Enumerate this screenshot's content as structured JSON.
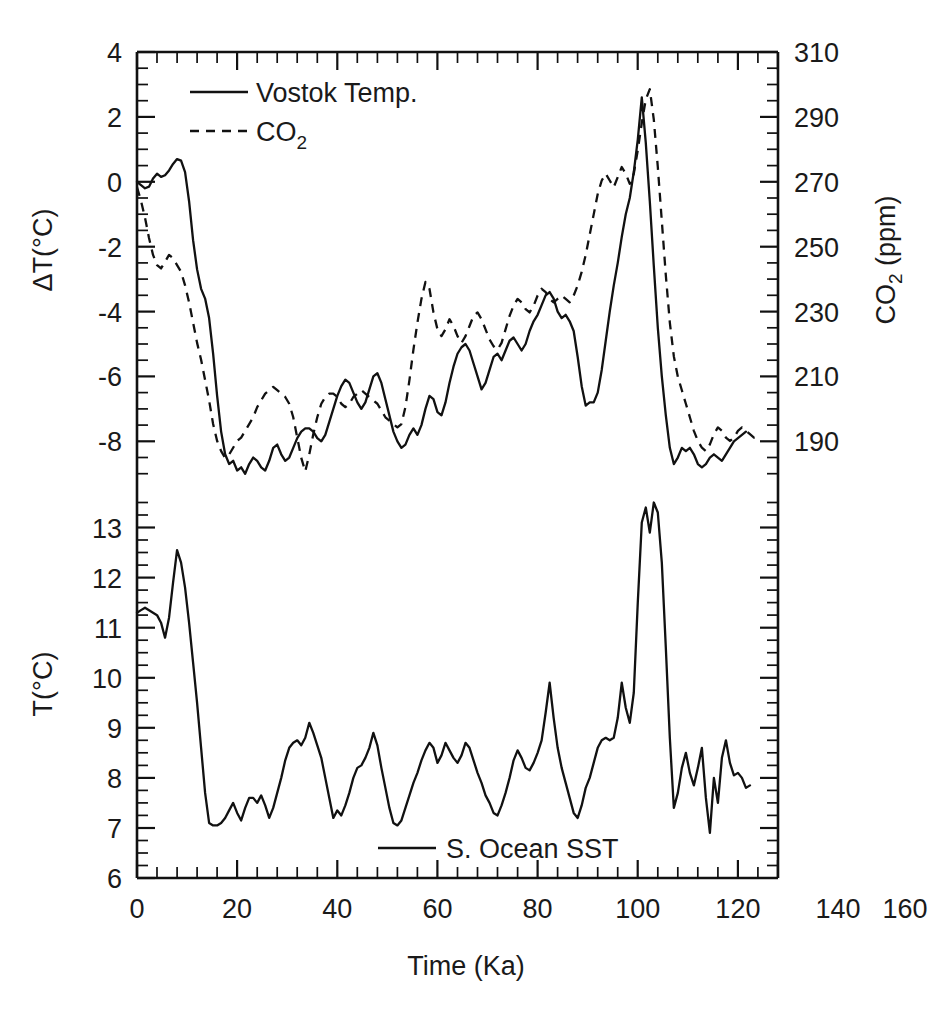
{
  "figure": {
    "background_color": "#ffffff",
    "line_color": "#111111",
    "xlabel": "Time (Ka)"
  },
  "chart_data": [
    {
      "type": "line",
      "panel": "top",
      "title": "",
      "xlabel": "Time (Ka)",
      "ylabel": "ΔT(°C)",
      "ylabel_right": "CO2 (ppm)",
      "ylabel_right_base": "CO",
      "ylabel_right_sub": "2",
      "ylabel_right_unit": " (ppm)",
      "xlim": [
        0,
        160
      ],
      "ylim": [
        -9.5,
        4
      ],
      "ylim_right": [
        180.5,
        310
      ],
      "xticks": [
        0,
        20,
        40,
        60,
        80,
        100,
        120,
        140,
        160
      ],
      "yticks": [
        4,
        2,
        0,
        -2,
        -4,
        -6,
        -8
      ],
      "yticks_right": [
        310,
        290,
        270,
        250,
        230,
        210,
        190
      ],
      "minor_ticks_per_interval": 4,
      "grid": false,
      "legend_position": "upper-left",
      "series": [
        {
          "name": "Vostok Temp.",
          "style": "solid",
          "axis": "left",
          "x": [
            0,
            1,
            2,
            3,
            4,
            5,
            6,
            7,
            8,
            9,
            10,
            11,
            12,
            13,
            14,
            15,
            16,
            17,
            18,
            19,
            20,
            21,
            22,
            23,
            24,
            25,
            26,
            27,
            28,
            29,
            30,
            31,
            32,
            33,
            34,
            35,
            36,
            37,
            38,
            39,
            40,
            41,
            42,
            43,
            44,
            45,
            46,
            47,
            48,
            49,
            50,
            51,
            52,
            53,
            54,
            55,
            56,
            57,
            58,
            59,
            60,
            61,
            62,
            63,
            64,
            65,
            66,
            67,
            68,
            69,
            70,
            71,
            72,
            73,
            74,
            75,
            76,
            77,
            78,
            79,
            80,
            81,
            82,
            83,
            84,
            85,
            86,
            87,
            88,
            89,
            90,
            91,
            92,
            93,
            94,
            95,
            96,
            97,
            98,
            99,
            100,
            101,
            102,
            103,
            104,
            105,
            106,
            107,
            108,
            109,
            110,
            111,
            112,
            113,
            114,
            115,
            116,
            117,
            118,
            119,
            120,
            121,
            122,
            123,
            124,
            125,
            126,
            127,
            128,
            129,
            130,
            131,
            132,
            133,
            134,
            135,
            136,
            137,
            138,
            139,
            140,
            141,
            142,
            143,
            144,
            145,
            146,
            147,
            148,
            149,
            150,
            151,
            152,
            153,
            154,
            155
          ],
          "y": [
            0.0,
            -0.1,
            -0.2,
            -0.15,
            0.1,
            0.25,
            0.15,
            0.2,
            0.35,
            0.55,
            0.7,
            0.65,
            0.3,
            -0.6,
            -1.8,
            -2.7,
            -3.3,
            -3.6,
            -4.2,
            -5.3,
            -6.6,
            -7.7,
            -8.4,
            -8.7,
            -8.6,
            -8.9,
            -8.8,
            -9.0,
            -8.7,
            -8.5,
            -8.6,
            -8.8,
            -8.9,
            -8.6,
            -8.2,
            -8.1,
            -8.4,
            -8.6,
            -8.5,
            -8.2,
            -7.9,
            -7.7,
            -7.6,
            -7.6,
            -7.7,
            -7.9,
            -8.0,
            -7.8,
            -7.4,
            -7.0,
            -6.6,
            -6.3,
            -6.1,
            -6.2,
            -6.5,
            -6.8,
            -7.0,
            -6.8,
            -6.4,
            -6.0,
            -5.9,
            -6.2,
            -6.7,
            -7.2,
            -7.7,
            -8.0,
            -8.2,
            -8.1,
            -7.8,
            -7.6,
            -7.8,
            -7.5,
            -7.0,
            -6.6,
            -6.7,
            -7.1,
            -7.2,
            -6.8,
            -6.2,
            -5.7,
            -5.3,
            -5.1,
            -5.0,
            -5.2,
            -5.6,
            -6.0,
            -6.4,
            -6.2,
            -5.8,
            -5.4,
            -5.3,
            -5.5,
            -5.2,
            -4.9,
            -4.8,
            -5.0,
            -5.2,
            -5.0,
            -4.6,
            -4.3,
            -4.1,
            -3.8,
            -3.5,
            -3.4,
            -3.6,
            -4.0,
            -4.2,
            -4.1,
            -4.3,
            -4.6,
            -5.4,
            -6.3,
            -6.9,
            -6.8,
            -6.8,
            -6.5,
            -5.8,
            -4.9,
            -4.0,
            -3.2,
            -2.5,
            -1.7,
            -1.0,
            -0.5,
            0.3,
            1.3,
            2.6,
            1.2,
            -0.6,
            -2.6,
            -4.5,
            -6.0,
            -7.2,
            -8.2,
            -8.7,
            -8.5,
            -8.2,
            -8.3,
            -8.2,
            -8.4,
            -8.7,
            -8.8,
            -8.7,
            -8.5,
            -8.4,
            -8.5,
            -8.6,
            -8.4,
            -8.2,
            -8.0,
            -7.9,
            -7.8,
            -7.7
          ]
        },
        {
          "name": "CO2",
          "label_base": "CO",
          "label_sub": "2",
          "style": "dashed",
          "axis": "right",
          "x": [
            0,
            1,
            2,
            3,
            4,
            5,
            6,
            7,
            8,
            9,
            10,
            11,
            12,
            13,
            14,
            15,
            16,
            17,
            18,
            19,
            20,
            21,
            22,
            23,
            24,
            25,
            26,
            27,
            28,
            29,
            30,
            31,
            32,
            33,
            34,
            35,
            36,
            37,
            38,
            39,
            40,
            41,
            42,
            43,
            44,
            45,
            46,
            47,
            48,
            49,
            50,
            51,
            52,
            53,
            54,
            55,
            56,
            57,
            58,
            59,
            60,
            61,
            62,
            63,
            64,
            65,
            66,
            67,
            68,
            69,
            70,
            71,
            72,
            73,
            74,
            75,
            76,
            77,
            78,
            79,
            80,
            81,
            82,
            83,
            84,
            85,
            86,
            87,
            88,
            89,
            90,
            91,
            92,
            93,
            94,
            95,
            96,
            97,
            98,
            99,
            100,
            101,
            102,
            103,
            104,
            105,
            106,
            107,
            108,
            109,
            110,
            111,
            112,
            113,
            114,
            115,
            116,
            117,
            118,
            119,
            120,
            121,
            122,
            123,
            124,
            125,
            126,
            127,
            128,
            129,
            130,
            131,
            132,
            133,
            134,
            135,
            136,
            137,
            138,
            139,
            140,
            141,
            142,
            143,
            144,
            145,
            146,
            147,
            148,
            149,
            150,
            151,
            152,
            153,
            154,
            155
          ],
          "y_ppm": [
            270,
            266,
            261,
            255,
            250,
            247,
            246,
            248,
            250,
            249,
            247,
            245,
            241,
            236,
            230,
            224,
            219,
            213,
            207,
            200,
            195,
            192,
            190,
            191,
            193,
            195,
            196,
            198,
            200,
            202,
            205,
            207,
            209,
            210,
            211,
            210,
            209,
            208,
            206,
            202,
            196,
            190,
            186,
            191,
            197,
            202,
            206,
            208,
            209,
            209,
            208,
            206,
            205,
            206,
            208,
            209,
            210,
            209,
            208,
            207,
            206,
            204,
            202,
            201,
            200,
            199,
            200,
            205,
            213,
            222,
            230,
            237,
            242,
            240,
            233,
            228,
            226,
            228,
            231,
            229,
            226,
            224,
            226,
            229,
            232,
            233,
            231,
            228,
            225,
            223,
            222,
            224,
            228,
            232,
            235,
            237,
            236,
            234,
            233,
            235,
            238,
            240,
            239,
            237,
            236,
            237,
            238,
            237,
            236,
            238,
            241,
            245,
            250,
            256,
            262,
            268,
            272,
            274,
            272,
            270,
            273,
            276,
            274,
            271,
            274,
            281,
            289,
            296,
            299,
            290,
            276,
            260,
            244,
            230,
            220,
            214,
            210,
            206,
            202,
            198,
            195,
            193,
            192,
            194,
            197,
            199,
            198,
            196,
            195,
            196,
            198,
            199,
            198,
            197,
            196,
            197,
            198
          ]
        }
      ]
    },
    {
      "type": "line",
      "panel": "bottom",
      "title": "",
      "xlabel": "Time (Ka)",
      "ylabel": "T(°C)",
      "xlim": [
        0,
        160
      ],
      "ylim": [
        6,
        13.75
      ],
      "xticks": [
        0,
        20,
        40,
        60,
        80,
        100,
        120,
        140,
        160
      ],
      "yticks": [
        13,
        12,
        11,
        10,
        9,
        8,
        7,
        6
      ],
      "minor_ticks_per_interval": 4,
      "grid": false,
      "legend_position": "bottom-center",
      "series": [
        {
          "name": "S. Ocean SST",
          "style": "solid",
          "axis": "left",
          "x": [
            0,
            1,
            2,
            3,
            4,
            5,
            6,
            7,
            8,
            9,
            10,
            11,
            12,
            13,
            14,
            15,
            16,
            17,
            18,
            19,
            20,
            21,
            22,
            23,
            24,
            25,
            26,
            27,
            28,
            29,
            30,
            31,
            32,
            33,
            34,
            35,
            36,
            37,
            38,
            39,
            40,
            41,
            42,
            43,
            44,
            45,
            46,
            47,
            48,
            49,
            50,
            51,
            52,
            53,
            54,
            55,
            56,
            57,
            58,
            59,
            60,
            61,
            62,
            63,
            64,
            65,
            66,
            67,
            68,
            69,
            70,
            71,
            72,
            73,
            74,
            75,
            76,
            77,
            78,
            79,
            80,
            81,
            82,
            83,
            84,
            85,
            86,
            87,
            88,
            89,
            90,
            91,
            92,
            93,
            94,
            95,
            96,
            97,
            98,
            99,
            100,
            101,
            102,
            103,
            104,
            105,
            106,
            107,
            108,
            109,
            110,
            111,
            112,
            113,
            114,
            115,
            116,
            117,
            118,
            119,
            120,
            121,
            122,
            123,
            124,
            125,
            126,
            127,
            128,
            129,
            130,
            131,
            132,
            133,
            134,
            135,
            136,
            137,
            138,
            139,
            140,
            141,
            142,
            143,
            144,
            145,
            146,
            147,
            148,
            149,
            150,
            151,
            152,
            153,
            154,
            155
          ],
          "y": [
            11.3,
            11.35,
            11.4,
            11.35,
            11.3,
            11.25,
            11.1,
            10.8,
            11.2,
            11.9,
            12.55,
            12.3,
            11.8,
            11.1,
            10.3,
            9.5,
            8.6,
            7.7,
            7.1,
            7.05,
            7.05,
            7.1,
            7.2,
            7.35,
            7.5,
            7.3,
            7.15,
            7.4,
            7.6,
            7.6,
            7.5,
            7.65,
            7.45,
            7.2,
            7.4,
            7.7,
            8.0,
            8.35,
            8.6,
            8.7,
            8.75,
            8.65,
            8.8,
            9.1,
            8.9,
            8.65,
            8.4,
            8.0,
            7.6,
            7.2,
            7.35,
            7.25,
            7.45,
            7.7,
            8.0,
            8.2,
            8.25,
            8.4,
            8.6,
            8.9,
            8.65,
            8.2,
            7.8,
            7.4,
            7.1,
            7.05,
            7.15,
            7.4,
            7.65,
            7.9,
            8.1,
            8.35,
            8.55,
            8.7,
            8.6,
            8.3,
            8.45,
            8.7,
            8.55,
            8.4,
            8.3,
            8.45,
            8.7,
            8.6,
            8.35,
            8.1,
            7.9,
            7.65,
            7.5,
            7.3,
            7.25,
            7.45,
            7.7,
            8.0,
            8.35,
            8.55,
            8.4,
            8.2,
            8.15,
            8.3,
            8.5,
            8.75,
            9.3,
            9.9,
            9.2,
            8.6,
            8.2,
            7.9,
            7.6,
            7.3,
            7.2,
            7.45,
            7.8,
            8.0,
            8.3,
            8.6,
            8.75,
            8.8,
            8.75,
            8.8,
            9.2,
            9.9,
            9.4,
            9.1,
            9.7,
            11.5,
            13.1,
            13.4,
            12.9,
            13.5,
            13.3,
            12.3,
            10.6,
            8.8,
            7.4,
            7.7,
            8.2,
            8.5,
            8.1,
            7.85,
            8.2,
            8.6,
            7.6,
            6.9,
            8.0,
            7.5,
            8.4,
            8.75,
            8.3,
            8.05,
            8.1,
            8.0,
            7.8,
            7.85
          ]
        }
      ]
    }
  ],
  "top_panel": {
    "ylabel": "ΔT(°C)",
    "ylabel_right_base": "CO",
    "ylabel_right_sub": "2",
    "ylabel_right_rest": " (ppm)",
    "ytick_labels": [
      "4",
      "2",
      "0",
      "-2",
      "-4",
      "-6",
      "-8"
    ],
    "ytick_right_labels": [
      "310",
      "290",
      "270",
      "250",
      "230",
      "210",
      "190"
    ],
    "legend": [
      {
        "label": "Vostok Temp.",
        "style": "solid"
      },
      {
        "label_base": "CO",
        "label_sub": "2",
        "style": "dashed"
      }
    ]
  },
  "bottom_panel": {
    "ylabel": "T(°C)",
    "ytick_labels": [
      "13",
      "12",
      "11",
      "10",
      "9",
      "8",
      "7",
      "6"
    ],
    "xtick_labels": [
      "0",
      "20",
      "40",
      "60",
      "80",
      "100",
      "120",
      "140",
      "160"
    ],
    "xlabel": "Time (Ka)",
    "legend": [
      {
        "label": "S. Ocean SST",
        "style": "solid"
      }
    ]
  }
}
